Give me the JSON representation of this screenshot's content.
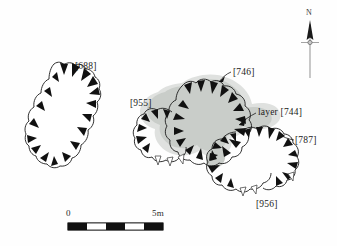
{
  "figure": {
    "kind": "archaeological-site-plan",
    "background_color": "#fefefe",
    "line_color": "#1a1a1a",
    "deposit_fill_color": "#c9cdc9",
    "deposit_shadow_color": "#dcdedc"
  },
  "features": [
    {
      "id": "688",
      "label": "[688]",
      "label_x": 75,
      "label_y": 62,
      "hachure_style": "filled",
      "has_leader": false
    },
    {
      "id": "955",
      "label": "[955]",
      "label_x": 130,
      "label_y": 99,
      "hachure_style": "filled-and-open",
      "has_leader": false
    },
    {
      "id": "746",
      "label": "[746]",
      "label_x": 233,
      "label_y": 68,
      "hachure_style": "filled",
      "has_leader": true
    },
    {
      "id": "787",
      "label": "[787]",
      "label_x": 295,
      "label_y": 136,
      "hachure_style": "filled",
      "has_leader": true
    },
    {
      "id": "956",
      "label": "[956]",
      "label_x": 256,
      "label_y": 200,
      "hachure_style": "filled-and-open",
      "has_leader": false
    }
  ],
  "deposit": {
    "id": "744",
    "label": "layer [744]",
    "label_x": 258,
    "label_y": 108,
    "has_leader": true
  },
  "north_arrow": {
    "label": "N",
    "label_x": 308,
    "label_y": 14,
    "icon": "north-arrow-icon"
  },
  "scale_bar": {
    "start_label": "0",
    "end_label": "5m",
    "start_label_x": 66,
    "start_label_y": 209,
    "end_label_x": 155,
    "end_label_y": 209,
    "bar_left": 68,
    "bar_right": 163,
    "bar_top": 223,
    "bar_height": 7,
    "segments": [
      "black",
      "white",
      "black",
      "white",
      "black"
    ],
    "segment_count": 5,
    "units": "m",
    "total_length": 5
  }
}
